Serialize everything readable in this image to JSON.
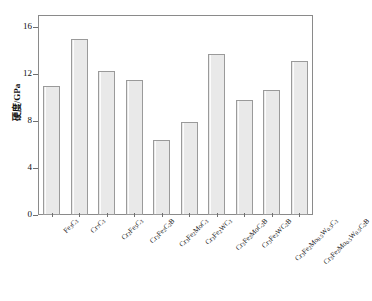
{
  "chart_data": {
    "type": "bar",
    "title": "",
    "xlabel": "",
    "ylabel": "硬度/GPa",
    "ylim": [
      0,
      17
    ],
    "yticks": [
      0,
      4,
      8,
      12,
      16
    ],
    "grid": false,
    "legend": "none",
    "bar_fill_color": "#e9e9e9",
    "bar_edge_color": "#9a9a9a",
    "axis_color": "#8a8a8a",
    "categories": [
      "Fe3C3",
      "Cr7C3",
      "Cr2Fe5C3",
      "Cr3Fe2C2B",
      "Cr3Fe2MoC3",
      "Cr3Fe2WC3",
      "Cr3Fe2MoC2B",
      "Cr3Fe2WC2B",
      "Cr3Fe2Mo0.5W0.5C3",
      "Cr3Fe2Mo0.5W0.5C2B"
    ],
    "categories_html": [
      "Fe<sub>3</sub>C<sub>3</sub>",
      "Cr<sub>7</sub>C<sub>3</sub>",
      "Cr<sub>2</sub>Fe<sub>5</sub>C<sub>3</sub>",
      "Cr<sub>3</sub>Fe<sub>2</sub>C<sub>2</sub>B",
      "Cr<sub>3</sub>Fe<sub>2</sub>MoC<sub>3</sub>",
      "Cr<sub>3</sub>Fe<sub>2</sub>WC<sub>3</sub>",
      "Cr<sub>3</sub>Fe<sub>2</sub>MoC<sub>2</sub>B",
      "Cr<sub>3</sub>Fe<sub>2</sub>WC<sub>2</sub>B",
      "Cr<sub>3</sub>Fe<sub>2</sub>Mo<sub>0.5</sub>W<sub>0.5</sub>C<sub>3</sub>",
      "Cr<sub>3</sub>Fe<sub>2</sub>Mo<sub>0.5</sub>W<sub>0.5</sub>C<sub>2</sub>B"
    ],
    "values": [
      11.0,
      15.0,
      12.2,
      11.5,
      6.4,
      7.9,
      13.7,
      9.8,
      10.6,
      13.1
    ]
  }
}
